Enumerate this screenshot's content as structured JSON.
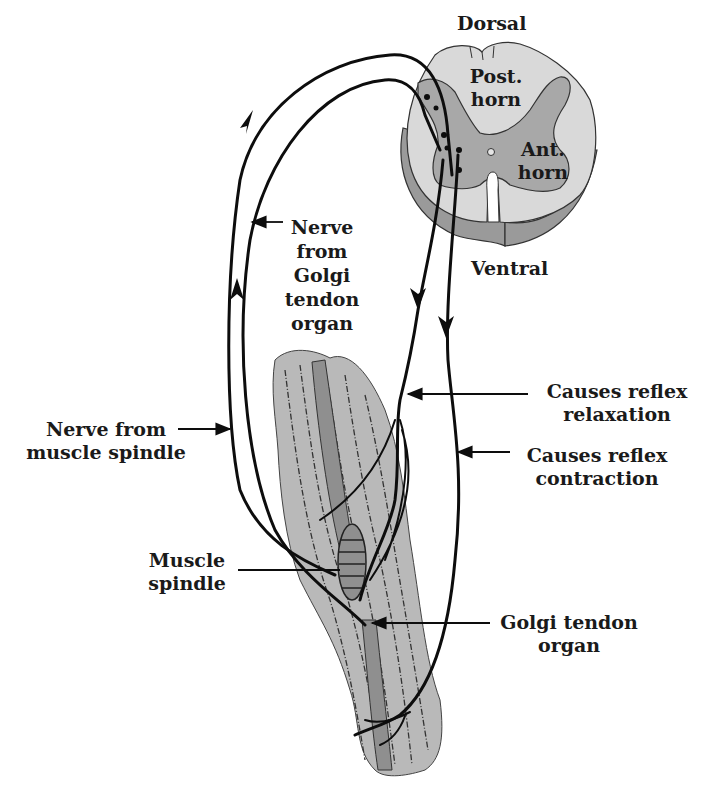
{
  "colors": {
    "background": "#ffffff",
    "spinal_white_matter": "#d9d9d9",
    "spinal_gray_matter": "#a8a8a8",
    "spinal_ventral_band": "#9a9a9a",
    "muscle_fill": "#b9b9b9",
    "tendon_fill": "#8f8f8f",
    "nerve_stroke": "#0d0d0d",
    "label_text": "#1a1a1a"
  },
  "spinal_cord": {
    "dorsal_label": "Dorsal",
    "ventral_label": "Ventral",
    "posterior_horn_label": [
      "Post.",
      "horn"
    ],
    "anterior_horn_label": [
      "Ant.",
      "horn"
    ]
  },
  "labels": {
    "nerve_golgi": [
      "Nerve",
      "from",
      "Golgi",
      "tendon",
      "organ"
    ],
    "nerve_spindle": [
      "Nerve from",
      "muscle spindle"
    ],
    "relaxation": [
      "Causes reflex",
      "relaxation"
    ],
    "contraction": [
      "Causes reflex",
      "contraction"
    ],
    "muscle_spindle": [
      "Muscle",
      "spindle"
    ],
    "golgi_tendon_organ": [
      "Golgi tendon",
      "organ"
    ]
  },
  "icons": {
    "arrowhead": "arrow-icon"
  }
}
